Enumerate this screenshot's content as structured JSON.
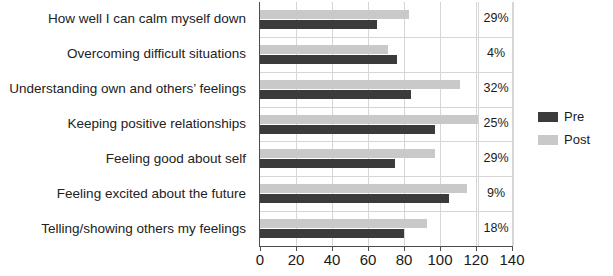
{
  "chart_data": {
    "type": "bar",
    "orientation": "horizontal",
    "title": "",
    "xlabel": "",
    "ylabel": "",
    "xlim": [
      0,
      140
    ],
    "xticks": [
      0,
      20,
      40,
      60,
      80,
      100,
      120,
      140
    ],
    "grid": true,
    "legend_position": "right",
    "categories": [
      "How well I can calm myself down",
      "Overcoming difficult situations",
      "Understanding own and others’ feelings",
      "Keeping positive relationships",
      "Feeling good about self",
      "Feeling excited about the future",
      "Telling/showing others my feelings"
    ],
    "series": [
      {
        "name": "Pre",
        "color": "#3b3b3b",
        "values": [
          65,
          76,
          84,
          97,
          75,
          105,
          80
        ]
      },
      {
        "name": "Post",
        "color": "#c9c9c9",
        "values": [
          83,
          71,
          111,
          121,
          97,
          115,
          93
        ]
      }
    ],
    "annotations": {
      "label": "percent change",
      "values": [
        "29%",
        "4%",
        "32%",
        "25%",
        "29%",
        "9%",
        "18%"
      ]
    }
  }
}
